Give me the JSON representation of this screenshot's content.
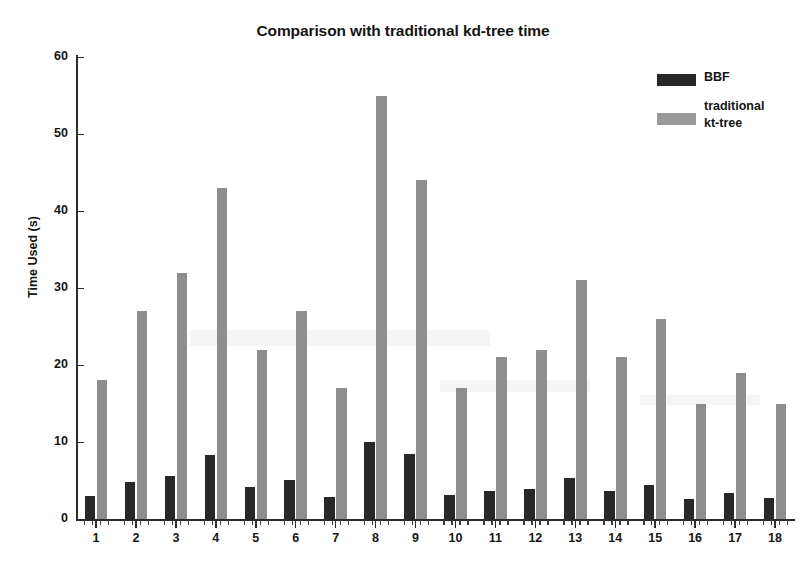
{
  "chart_data": {
    "type": "bar",
    "title": "Comparison with traditional kd-tree time",
    "xlabel": "",
    "ylabel": "Time Used (s)",
    "ylim": [
      0,
      60
    ],
    "yticks": [
      0,
      10,
      20,
      30,
      40,
      50,
      60
    ],
    "grid": false,
    "legend_position": "top-right",
    "categories": [
      "1",
      "2",
      "3",
      "4",
      "5",
      "6",
      "7",
      "8",
      "9",
      "10",
      "11",
      "12",
      "13",
      "14",
      "15",
      "16",
      "17",
      "18"
    ],
    "series": [
      {
        "name": "BBF",
        "color": "#282828",
        "values": [
          3.0,
          4.8,
          5.6,
          8.3,
          4.2,
          5.1,
          2.9,
          10.0,
          8.4,
          3.1,
          3.7,
          3.9,
          5.3,
          3.6,
          4.4,
          2.6,
          3.4,
          2.7
        ]
      },
      {
        "name": "traditional kt-tree",
        "color": "#8e8e8e",
        "values": [
          18,
          27,
          32,
          43,
          22,
          27,
          17,
          55,
          44,
          17,
          21,
          22,
          31,
          21,
          26,
          15,
          19,
          15
        ]
      }
    ]
  },
  "legend": {
    "entries": [
      {
        "label": "BBF",
        "swatch": "dark-swatch"
      },
      {
        "label_line1": "traditional",
        "label_line2": "kt-tree",
        "swatch": "gray-swatch"
      }
    ]
  },
  "axis": {
    "y_title": "Time Used (s)",
    "y_tick_labels": [
      "0",
      "10",
      "20",
      "30",
      "40",
      "50",
      "60"
    ],
    "x_tick_labels": [
      "1",
      "2",
      "3",
      "4",
      "5",
      "6",
      "7",
      "8",
      "9",
      "10",
      "11",
      "12",
      "13",
      "14",
      "15",
      "16",
      "17",
      "18"
    ]
  }
}
